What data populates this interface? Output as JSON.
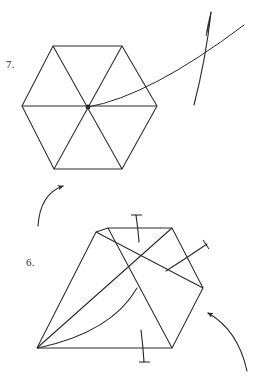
{
  "page": {
    "background_color": "#ffffff",
    "ink_color": "#2b2b2b",
    "width": 259,
    "height": 377
  },
  "figures": [
    {
      "id": "figure-7",
      "label": "7.",
      "label_position": {
        "x": 6,
        "y": 58
      },
      "shape": "hexagon-divided-into-six-triangles",
      "description": "regular hexagon with three long diagonals through the center",
      "vertices": [
        {
          "x": 53,
          "y": 46
        },
        {
          "x": 122,
          "y": 46
        },
        {
          "x": 157,
          "y": 106
        },
        {
          "x": 122,
          "y": 169
        },
        {
          "x": 54,
          "y": 169
        },
        {
          "x": 22,
          "y": 106
        }
      ],
      "center": {
        "x": 88,
        "y": 107
      },
      "diagonals": [
        [
          0,
          3
        ],
        [
          1,
          4
        ],
        [
          2,
          5
        ]
      ],
      "annotations": [
        {
          "name": "pointer-curve",
          "type": "curve",
          "from": {
            "x": 88,
            "y": 107
          },
          "control": {
            "x": 150,
            "y": 96
          },
          "to": {
            "x": 244,
            "y": 25
          }
        },
        {
          "name": "needle-tick",
          "type": "tick",
          "from": {
            "x": 194,
            "y": 105
          },
          "to": {
            "x": 211,
            "y": 12
          }
        }
      ]
    },
    {
      "id": "figure-6",
      "label": "6.",
      "label_position": {
        "x": 26,
        "y": 256
      },
      "shape": "skewed-hexagon-divided-into-six-triangles",
      "description": "obliquely projected hexagon with three diagonals through the center and a curved fold line",
      "vertices": [
        {
          "x": 108,
          "y": 228
        },
        {
          "x": 172,
          "y": 228
        },
        {
          "x": 203,
          "y": 288
        },
        {
          "x": 172,
          "y": 348
        },
        {
          "x": 37,
          "y": 348
        },
        {
          "x": 96,
          "y": 232
        }
      ],
      "center": {
        "x": 137,
        "y": 288
      },
      "diagonals": [
        [
          0,
          3
        ],
        [
          1,
          4
        ],
        [
          2,
          5
        ]
      ],
      "annotations": [
        {
          "name": "fold-curve",
          "type": "curve",
          "from": {
            "x": 38,
            "y": 348
          },
          "control": {
            "x": 112,
            "y": 330
          },
          "to": {
            "x": 137,
            "y": 288
          }
        },
        {
          "name": "top-needle-tick",
          "type": "tick",
          "from": {
            "x": 136,
            "y": 215
          },
          "to": {
            "x": 139,
            "y": 242
          }
        },
        {
          "name": "bottom-needle-tick",
          "type": "tick",
          "from": {
            "x": 141,
            "y": 330
          },
          "to": {
            "x": 144,
            "y": 363
          }
        },
        {
          "name": "side-needle-tick",
          "type": "tick",
          "from": {
            "x": 166,
            "y": 271
          },
          "to": {
            "x": 208,
            "y": 244
          }
        }
      ]
    }
  ],
  "arrows": [
    {
      "name": "rotation-arrow-left",
      "direction": "up-right",
      "from": {
        "x": 38,
        "y": 226
      },
      "control": {
        "x": 40,
        "y": 194
      },
      "to": {
        "x": 63,
        "y": 186
      }
    },
    {
      "name": "rotation-arrow-right",
      "direction": "up-left",
      "from": {
        "x": 247,
        "y": 371
      },
      "control": {
        "x": 238,
        "y": 330
      },
      "to": {
        "x": 208,
        "y": 313
      }
    }
  ]
}
